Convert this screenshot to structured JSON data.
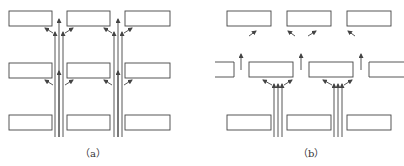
{
  "figure": {
    "panels": [
      {
        "id": "a",
        "caption": "（a）",
        "description": "Grid of 3x3 rectangles with two vertical bundles of three upward arrows passing between columns, branching diagonally toward adjacent rectangles at each row."
      },
      {
        "id": "b",
        "caption": "（b）",
        "description": "Three rows of rectangles; middle row offset; two vertical bundles of three arrows rise from bottom into middle-row rectangles which fan out; single upward arrows and diagonal arrows lead toward the top row."
      }
    ],
    "colors": {
      "stroke": "#444444",
      "background": "#ffffff"
    }
  }
}
